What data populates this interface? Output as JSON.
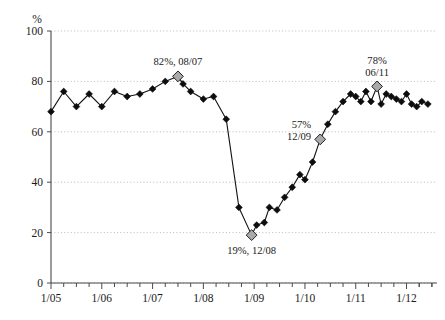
{
  "chart_data": {
    "type": "line",
    "title": "",
    "xlabel": "",
    "ylabel": "%",
    "ylim": [
      0,
      100
    ],
    "yticks": [
      0,
      20,
      40,
      60,
      80,
      100
    ],
    "xlim": [
      "1/05",
      "1/12"
    ],
    "xticks": [
      "1/05",
      "1/06",
      "1/07",
      "1/08",
      "1/09",
      "1/10",
      "1/11",
      "1/12"
    ],
    "minor_tick_interval": "quarterly",
    "grid": "horizontal dotted gridlines at each y tick",
    "legend": "none",
    "marker": "filled black diamond",
    "highlight_marker": "gray diamond with black outline",
    "series": [
      {
        "name": "value",
        "x": [
          2005.0,
          2005.25,
          2005.5,
          2005.75,
          2006.0,
          2006.25,
          2006.5,
          2006.75,
          2007.0,
          2007.25,
          2007.5,
          2007.6,
          2007.75,
          2008.0,
          2008.2,
          2008.45,
          2008.7,
          2008.95,
          2009.05,
          2009.2,
          2009.3,
          2009.45,
          2009.6,
          2009.75,
          2009.9,
          2010.0,
          2010.15,
          2010.3,
          2010.45,
          2010.6,
          2010.75,
          2010.9,
          2011.0,
          2011.1,
          2011.2,
          2011.3,
          2011.42,
          2011.5,
          2011.6,
          2011.7,
          2011.8,
          2011.9,
          2012.0,
          2012.1,
          2012.2,
          2012.3,
          2012.42
        ],
        "values": [
          68,
          76,
          70,
          75,
          70,
          76,
          74,
          75,
          77,
          80,
          82,
          79,
          76,
          73,
          74,
          65,
          30,
          19,
          23,
          24,
          30,
          29,
          34,
          38,
          43,
          41,
          48,
          57,
          63,
          68,
          72,
          75,
          74,
          72,
          76,
          72,
          78,
          71,
          75,
          74,
          73,
          72,
          75,
          71,
          70,
          72,
          71
        ]
      }
    ],
    "annotations": [
      {
        "text": "82%, 08/07",
        "x": 2007.5,
        "y": 82,
        "position": "above",
        "lines": [
          "82%, 08/07"
        ]
      },
      {
        "text": "19%, 12/08",
        "x": 2008.95,
        "y": 19,
        "position": "below",
        "lines": [
          "19%, 12/08"
        ]
      },
      {
        "text": "57% 12/09",
        "x": 2010.3,
        "y": 57,
        "position": "left",
        "lines": [
          "57%",
          "12/09"
        ]
      },
      {
        "text": "78% 06/11",
        "x": 2011.42,
        "y": 78,
        "position": "above",
        "lines": [
          "78%",
          "06/11"
        ]
      }
    ],
    "highlight_points": [
      {
        "x": 2007.5,
        "y": 82
      },
      {
        "x": 2008.95,
        "y": 19
      },
      {
        "x": 2010.3,
        "y": 57
      },
      {
        "x": 2011.42,
        "y": 78
      }
    ],
    "colors": {
      "line": "#111111",
      "marker": "#0d0d0d",
      "highlight": "#a9a9a9",
      "grid": "#b9b9b9",
      "axis": "#4a4a4a",
      "background": "#ffffff"
    }
  }
}
